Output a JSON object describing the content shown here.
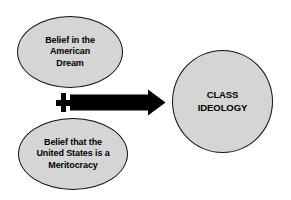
{
  "diagram": {
    "background_color": "#ffffff",
    "shape_fill_color": "#d5d5d5",
    "shape_stroke_color": "#111111",
    "arrow_color": "#000000",
    "inputs": [
      {
        "id": "american-dream",
        "shape": "ellipse",
        "label": "Belief in the\nAmerican\nDream"
      },
      {
        "id": "meritocracy",
        "shape": "ellipse",
        "label": "Belief that the\nUnited States is a\nMeritocracy"
      }
    ],
    "operator": {
      "id": "plus",
      "symbol": "+"
    },
    "connector": {
      "id": "arrow",
      "direction": "right"
    },
    "output": {
      "id": "class-ideology",
      "shape": "circle",
      "label": "CLASS\nIDEOLOGY"
    }
  }
}
